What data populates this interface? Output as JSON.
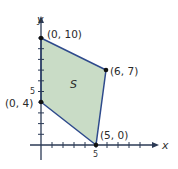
{
  "diagram": {
    "type": "feasible-region",
    "axes": {
      "x_label": "x",
      "y_label": "y",
      "x_tick_label": "5",
      "y_tick_label": "5"
    },
    "region": {
      "label": "S",
      "fill": "#c9dcc6",
      "stroke": "#2e4a8c"
    },
    "vertices": [
      {
        "label": "(0, 10)",
        "x": 0,
        "y": 10
      },
      {
        "label": "(6, 7)",
        "x": 6,
        "y": 7
      },
      {
        "label": "(5, 0)",
        "x": 5,
        "y": 0
      },
      {
        "label": "(0, 4)",
        "x": 0,
        "y": 4
      }
    ],
    "colors": {
      "axis": "#2b3a55",
      "vertex": "#111111"
    }
  }
}
